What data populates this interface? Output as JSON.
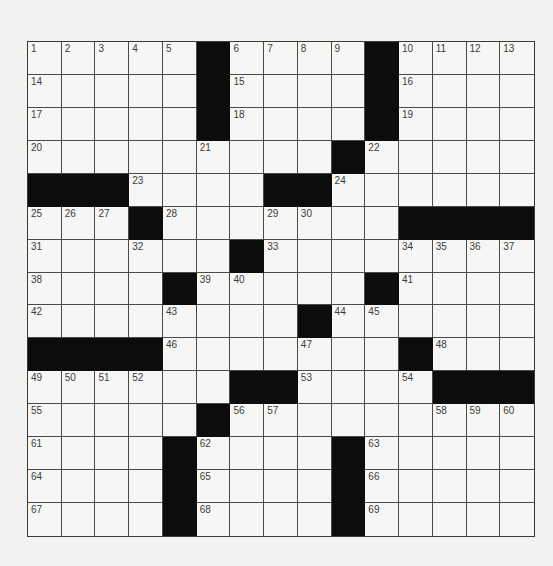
{
  "puzzle": {
    "rows": 15,
    "cols": 15,
    "colors": {
      "block": "#0c0c0c",
      "cell": "#f6f6f4",
      "line": "#4a4a4a",
      "number": "#3c3c3c",
      "page": "#f2f2f0"
    },
    "grid": [
      [
        "1",
        "2",
        "3",
        "4",
        "5",
        "#",
        "6",
        "7",
        "8",
        "9",
        "#",
        "10",
        "11",
        "12",
        "13"
      ],
      [
        "14",
        "",
        "",
        "",
        "",
        "#",
        "15",
        "",
        "",
        "",
        "#",
        "16",
        "",
        "",
        ""
      ],
      [
        "17",
        "",
        "",
        "",
        "",
        "#",
        "18",
        "",
        "",
        "",
        "#",
        "19",
        "",
        "",
        ""
      ],
      [
        "20",
        "",
        "",
        "",
        "",
        "21",
        "",
        "",
        "",
        "#",
        "22",
        "",
        "",
        "",
        ""
      ],
      [
        "#",
        "#",
        "#",
        "23",
        "",
        "",
        "",
        "#",
        "#",
        "24",
        "",
        "",
        "",
        "",
        ""
      ],
      [
        "25",
        "26",
        "27",
        "#",
        "28",
        "",
        "",
        "29",
        "30",
        "",
        "",
        "#",
        "#",
        "#",
        "#"
      ],
      [
        "31",
        "",
        "",
        "32",
        "",
        "",
        "#",
        "33",
        "",
        "",
        "",
        "34",
        "35",
        "36",
        "37"
      ],
      [
        "38",
        "",
        "",
        "",
        "#",
        "39",
        "40",
        "",
        "",
        "",
        "#",
        "41",
        "",
        "",
        ""
      ],
      [
        "42",
        "",
        "",
        "",
        "43",
        "",
        "",
        "",
        "#",
        "44",
        "45",
        "",
        "",
        "",
        ""
      ],
      [
        "#",
        "#",
        "#",
        "#",
        "46",
        "",
        "",
        "",
        "47",
        "",
        "",
        "#",
        "48",
        "",
        ""
      ],
      [
        "49",
        "50",
        "51",
        "52",
        "",
        "",
        "#",
        "#",
        "53",
        "",
        "",
        "54",
        "#",
        "#",
        "#"
      ],
      [
        "55",
        "",
        "",
        "",
        "",
        "#",
        "56",
        "57",
        "",
        "",
        "",
        "",
        "58",
        "59",
        "60"
      ],
      [
        "61",
        "",
        "",
        "",
        "#",
        "62",
        "",
        "",
        "",
        "#",
        "63",
        "",
        "",
        "",
        ""
      ],
      [
        "64",
        "",
        "",
        "",
        "#",
        "65",
        "",
        "",
        "",
        "#",
        "66",
        "",
        "",
        "",
        ""
      ],
      [
        "67",
        "",
        "",
        "",
        "#",
        "68",
        "",
        "",
        "",
        "#",
        "69",
        "",
        "",
        "",
        ""
      ]
    ]
  }
}
